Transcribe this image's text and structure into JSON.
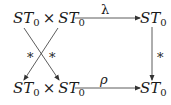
{
  "diagram": {
    "type": "commutative-diagram",
    "nodes": {
      "top_left": {
        "left": "ST",
        "left_sub": "0",
        "op": "×",
        "right": "ST",
        "right_sub": "0"
      },
      "top_right": {
        "main": "ST",
        "sub": "0"
      },
      "bottom_left": {
        "left": "ST",
        "left_sub": "0",
        "op": "×",
        "right": "ST",
        "right_sub": "0"
      },
      "bottom_right": {
        "main": "ST",
        "sub": "0"
      }
    },
    "arrows": {
      "top": {
        "label": "λ",
        "from": "top_left",
        "to": "top_right"
      },
      "bottom": {
        "label": "ρ",
        "from": "bottom_left",
        "to": "bottom_right"
      },
      "right": {
        "label": "*",
        "from": "top_right",
        "to": "bottom_right"
      },
      "cross_left": {
        "label": "*",
        "from": "top_left",
        "to": "bottom_left"
      },
      "cross_right": {
        "label": "*",
        "from": "top_left",
        "to": "bottom_left"
      }
    },
    "colors": {
      "ink": "#1a1a1a",
      "line": "#333333",
      "background": "#ffffff"
    }
  }
}
